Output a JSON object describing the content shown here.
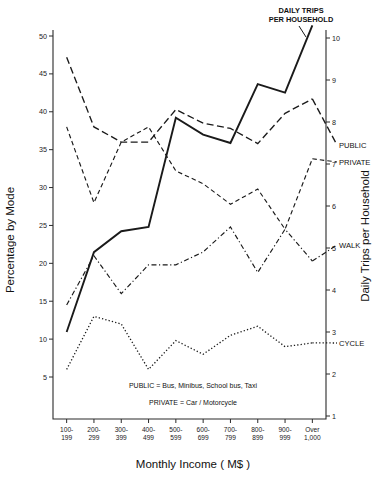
{
  "chart_data": {
    "type": "line",
    "title": "DAILY TRIPS PER HOUSEHOLD",
    "title_line1": "DAILY TRIPS",
    "title_line2": "PER HOUSEHOLD",
    "xlabel": "Monthly Income ( M$ )",
    "ylabel": "Percentage by Mode",
    "ylabel_right": "Daily Trips per Household",
    "grid": false,
    "legend_position": "inline-end-of-line",
    "categories": [
      "100-199",
      "200-299",
      "300-399",
      "400-499",
      "500-599",
      "600-699",
      "700-799",
      "800-899",
      "900-999",
      "Over 1,000"
    ],
    "categories_wrapped": [
      [
        "100-",
        "199"
      ],
      [
        "200-",
        "299"
      ],
      [
        "300-",
        "399"
      ],
      [
        "400-",
        "499"
      ],
      [
        "500-",
        "599"
      ],
      [
        "600-",
        "699"
      ],
      [
        "700-",
        "799"
      ],
      [
        "800-",
        "899"
      ],
      [
        "900-",
        "999"
      ],
      [
        "Over",
        "1,000"
      ]
    ],
    "ylim": [
      0,
      51
    ],
    "yticks": [
      5,
      10,
      15,
      20,
      25,
      30,
      35,
      40,
      45,
      50
    ],
    "ylim_right": [
      0,
      10.4
    ],
    "yticks_right": [
      1,
      2,
      3,
      4,
      5,
      6,
      7,
      8,
      9,
      10
    ],
    "series": [
      {
        "name": "PUBLIC",
        "label": "PUBLIC",
        "axis": "left",
        "linestyle": "long-dash",
        "values": [
          47.2,
          38.0,
          36.0,
          36.0,
          40.3,
          38.5,
          37.8,
          35.8,
          39.8,
          41.7
        ],
        "label_end_value": 36.3
      },
      {
        "name": "PRIVATE",
        "label": "PRIVATE",
        "axis": "left",
        "linestyle": "dash",
        "values": [
          38.0,
          28.0,
          36.0,
          38.0,
          32.2,
          30.5,
          27.8,
          29.8,
          24.5,
          33.8
        ],
        "label_end_value": 33.8
      },
      {
        "name": "WALK",
        "label": "WALK",
        "axis": "left",
        "linestyle": "dash-dot",
        "values": [
          14.5,
          21.0,
          16.0,
          19.8,
          19.8,
          21.5,
          24.8,
          18.8,
          24.5,
          20.3
        ],
        "label_end_value": 20.3
      },
      {
        "name": "CYCLE",
        "label": "CYCLE",
        "axis": "left",
        "linestyle": "dotted",
        "values": [
          6.0,
          13.0,
          12.0,
          6.0,
          9.8,
          8.0,
          10.5,
          11.7,
          9.0,
          9.5
        ],
        "label_end_value": 9.5
      },
      {
        "name": "DAILY TRIPS PER HOUSEHOLD",
        "label": "",
        "axis": "right",
        "linestyle": "solid",
        "values": [
          3.0,
          4.9,
          5.4,
          5.5,
          8.1,
          7.7,
          7.5,
          8.9,
          8.7,
          10.3
        ],
        "label_end_value": 10.3
      }
    ],
    "annotations": [
      "PUBLIC = Bus, Minibus, School bus, Taxi",
      "PRIVATE = Car / Motorcycle"
    ]
  }
}
